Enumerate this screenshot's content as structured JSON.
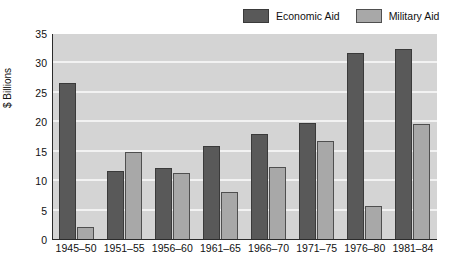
{
  "chart_data": {
    "type": "bar",
    "title": "",
    "xlabel": "",
    "ylabel": "$ Billions",
    "ylim": [
      0,
      35
    ],
    "yticks": [
      0,
      5,
      10,
      15,
      20,
      25,
      30,
      35
    ],
    "ytick_labels": [
      "0",
      "5",
      "10",
      "15",
      "20",
      "25",
      "30",
      "35"
    ],
    "grid": true,
    "grid_axis": "y",
    "legend_position": "top-right",
    "orientation": "vertical",
    "grouping": "grouped",
    "categories": [
      "1945–50",
      "1951–55",
      "1956–60",
      "1961–65",
      "1966–70",
      "1971–75",
      "1976–80",
      "1981–84"
    ],
    "series": [
      {
        "name": "Economic Aid",
        "color": "#595959",
        "values": [
          26.7,
          11.8,
          12.3,
          15.9,
          18.0,
          19.9,
          31.8,
          32.4
        ]
      },
      {
        "name": "Military Aid",
        "color": "#a8a8a8",
        "values": [
          2.2,
          14.9,
          11.4,
          8.1,
          12.4,
          16.8,
          5.8,
          19.7
        ]
      }
    ]
  },
  "legend": {
    "entries": [
      {
        "label": "Economic Aid",
        "color": "#595959"
      },
      {
        "label": "Military Aid",
        "color": "#a8a8a8"
      }
    ]
  },
  "axes": {
    "y_title": "$ Billions"
  },
  "style": {
    "plot_background": "#d4d4d4",
    "gridline_color": "#f2f2f2",
    "axis_color": "#2b2b2b",
    "page_background": "#ffffff"
  }
}
